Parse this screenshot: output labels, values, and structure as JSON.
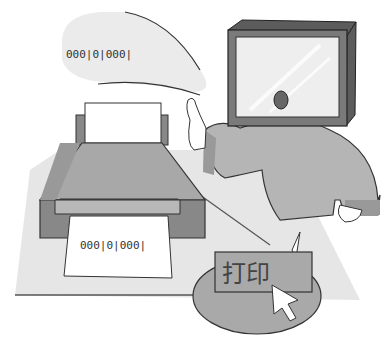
{
  "illustration": {
    "speech_bubble": {
      "binary_text": "000|0|000|"
    },
    "printed_paper": {
      "binary_text": "000|0|000|"
    },
    "print_button": {
      "label": "打印"
    },
    "colors": {
      "background": "#ffffff",
      "floor": "#e6e6e6",
      "printer_body": "#a8a8a8",
      "printer_dark": "#888888",
      "person_body": "#b5b5b5",
      "monitor_frame": "#7a7a7a",
      "monitor_screen": "#eeeeee",
      "oval_bubble": "#a9a9a9"
    }
  }
}
